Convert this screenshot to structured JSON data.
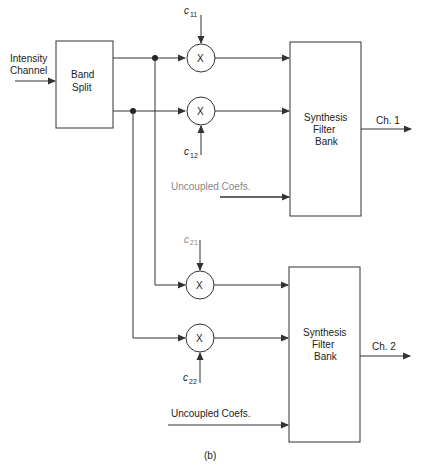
{
  "diagram": {
    "caption": "(b)",
    "input": {
      "label_line1": "Intensity",
      "label_line2": "Channel"
    },
    "band_split": {
      "line1": "Band",
      "line2": "Split"
    },
    "multipliers": [
      {
        "symbol": "X",
        "coef": "c",
        "coef_sub": "11"
      },
      {
        "symbol": "X",
        "coef": "c",
        "coef_sub": "12"
      },
      {
        "symbol": "X",
        "coef": "c",
        "coef_sub": "21"
      },
      {
        "symbol": "X",
        "coef": "c",
        "coef_sub": "22"
      }
    ],
    "synthesis_banks": [
      {
        "line1": "Synthesis",
        "line2": "Filter",
        "line3": "Bank",
        "output": "Ch. 1",
        "uncoupled": "Uncoupled Coefs."
      },
      {
        "line1": "Synthesis",
        "line2": "Filter",
        "line3": "Bank",
        "output": "Ch. 2",
        "uncoupled": "Uncoupled Coefs."
      }
    ],
    "colors": {
      "line": "#333333",
      "text": "#222222",
      "background": "#ffffff"
    }
  }
}
